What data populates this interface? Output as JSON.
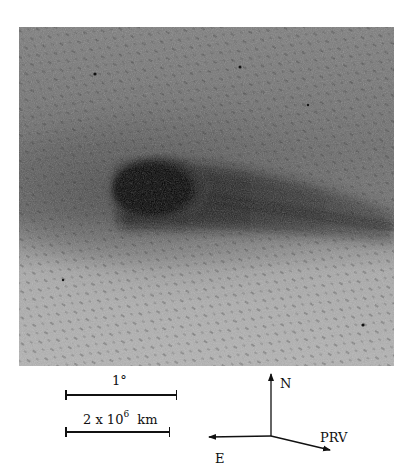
{
  "image": {
    "subject": "comet",
    "description": "Negative (inverted) photographic plate of a comet: dark coma at left-center with tail extending to the right against a star field with diagonal star trails",
    "photo_colors": {
      "background": "#8a8a8a",
      "coma": "#050505",
      "tail": "#2a2a2a",
      "bright_lower": "#b5b5b5"
    }
  },
  "scale_bars": [
    {
      "label": "1°",
      "length_px": 111
    },
    {
      "label_base": "2 x 10",
      "label_exponent": "6",
      "label_unit": "km",
      "length_px": 104
    }
  ],
  "compass": {
    "north_label": "N",
    "east_label": "E",
    "prv_label": "PRV"
  }
}
